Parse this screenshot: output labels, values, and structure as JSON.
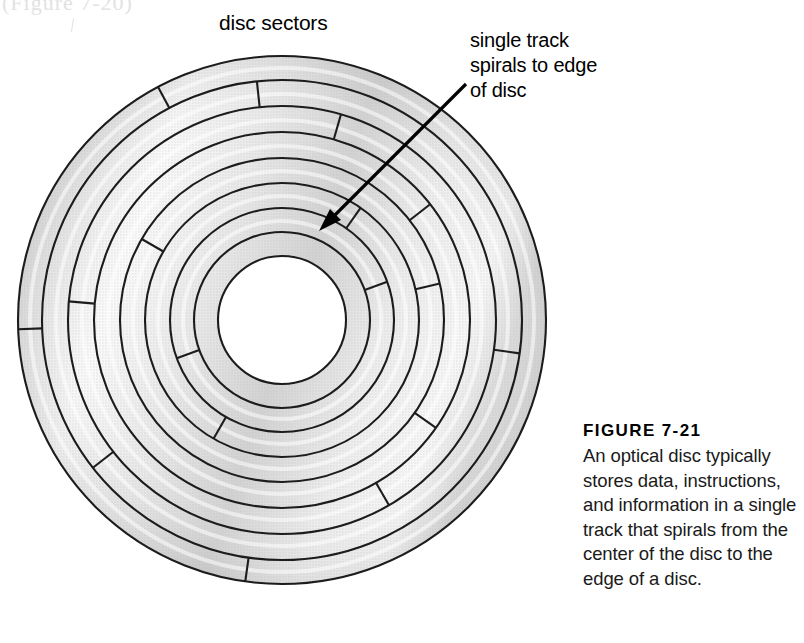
{
  "page": {
    "ghost_text": "(Figure 7-20)",
    "background": "#ffffff"
  },
  "labels": {
    "sectors": "disc sectors",
    "callout_line1": "single track",
    "callout_line2": "spirals to edge",
    "callout_line3": "of disc"
  },
  "caption": {
    "title": "FIGURE 7-21",
    "body": "An optical disc typically stores data, instructions, and information in a single track that spirals from the center of the disc to the edge of a disc."
  },
  "figure": {
    "type": "optical-disc-diagram",
    "center": {
      "x": 282,
      "y": 320
    },
    "outer_radius": 264,
    "hole_radius": 64,
    "ring_boundaries": [
      264,
      240,
      214,
      188,
      162,
      137,
      112,
      88,
      64
    ],
    "ring_count": 8,
    "fill_color": "#d6d6d6",
    "highlight_color": "#fbfbfb",
    "stroke_color": "#1c1c1c",
    "hole_color": "#ffffff",
    "sector_dividers": [
      {
        "angle_deg": 118,
        "ring": 0
      },
      {
        "angle_deg": 96,
        "ring": 1
      },
      {
        "angle_deg": 74,
        "ring": 2
      },
      {
        "angle_deg": 38,
        "ring": 3
      },
      {
        "angle_deg": 13,
        "ring": 4
      },
      {
        "angle_deg": 175,
        "ring": 2
      },
      {
        "angle_deg": 182,
        "ring": 0
      },
      {
        "angle_deg": 150,
        "ring": 4
      },
      {
        "angle_deg": 352,
        "ring": 1
      },
      {
        "angle_deg": 325,
        "ring": 3
      },
      {
        "angle_deg": 300,
        "ring": 2
      },
      {
        "angle_deg": 262,
        "ring": 0
      },
      {
        "angle_deg": 218,
        "ring": 1
      },
      {
        "angle_deg": 240,
        "ring": 5
      },
      {
        "angle_deg": 200,
        "ring": 6
      },
      {
        "angle_deg": 20,
        "ring": 6
      },
      {
        "angle_deg": 55,
        "ring": 5
      }
    ],
    "arrow": {
      "from": {
        "x": 466,
        "y": 84
      },
      "to": {
        "x": 319,
        "y": 231
      }
    }
  }
}
